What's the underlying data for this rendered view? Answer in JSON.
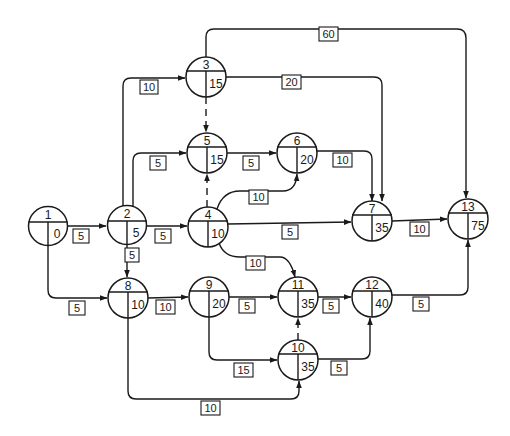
{
  "diagram": {
    "type": "activity-on-node network (earliest event times)",
    "nodes": [
      {
        "id": "1",
        "value": "0",
        "x": 48,
        "y": 226
      },
      {
        "id": "2",
        "value": "5",
        "x": 127,
        "y": 225
      },
      {
        "id": "3",
        "value": "15",
        "x": 206,
        "y": 77
      },
      {
        "id": "4",
        "value": "10",
        "x": 208,
        "y": 227
      },
      {
        "id": "5",
        "value": "15",
        "x": 207,
        "y": 153
      },
      {
        "id": "6",
        "value": "20",
        "x": 297,
        "y": 153
      },
      {
        "id": "7",
        "value": "35",
        "x": 372,
        "y": 221
      },
      {
        "id": "8",
        "value": "10",
        "x": 128,
        "y": 298
      },
      {
        "id": "9",
        "value": "20",
        "x": 209,
        "y": 297
      },
      {
        "id": "10",
        "value": "35",
        "x": 298,
        "y": 360
      },
      {
        "id": "11",
        "value": "35",
        "x": 298,
        "y": 297
      },
      {
        "id": "12",
        "value": "40",
        "x": 372,
        "y": 297
      },
      {
        "id": "13",
        "value": "75",
        "x": 468,
        "y": 219
      }
    ],
    "edges": [
      {
        "from": "1",
        "to": "2",
        "duration": "5",
        "dummy": false
      },
      {
        "from": "1",
        "to": "8",
        "duration": "5",
        "dummy": false
      },
      {
        "from": "2",
        "to": "3",
        "duration": "10",
        "dummy": false
      },
      {
        "from": "2",
        "to": "5",
        "duration": "5",
        "dummy": false
      },
      {
        "from": "2",
        "to": "4",
        "duration": "5",
        "dummy": false
      },
      {
        "from": "2",
        "to": "8",
        "duration": "5",
        "dummy": false
      },
      {
        "from": "3",
        "to": "13",
        "duration": "60",
        "dummy": false
      },
      {
        "from": "3",
        "to": "7",
        "duration": "20",
        "dummy": false
      },
      {
        "from": "3",
        "to": "5",
        "duration": "",
        "dummy": true
      },
      {
        "from": "4",
        "to": "5",
        "duration": "",
        "dummy": true
      },
      {
        "from": "5",
        "to": "6",
        "duration": "5",
        "dummy": false
      },
      {
        "from": "4",
        "to": "6",
        "duration": "10",
        "dummy": false
      },
      {
        "from": "6",
        "to": "7",
        "duration": "10",
        "dummy": false
      },
      {
        "from": "4",
        "to": "7",
        "duration": "5",
        "dummy": false
      },
      {
        "from": "4",
        "to": "11",
        "duration": "10",
        "dummy": false
      },
      {
        "from": "7",
        "to": "13",
        "duration": "10",
        "dummy": false
      },
      {
        "from": "8",
        "to": "9",
        "duration": "10",
        "dummy": false
      },
      {
        "from": "8",
        "to": "10",
        "duration": "10",
        "dummy": false
      },
      {
        "from": "9",
        "to": "11",
        "duration": "5",
        "dummy": false
      },
      {
        "from": "9",
        "to": "10",
        "duration": "15",
        "dummy": false
      },
      {
        "from": "10",
        "to": "11",
        "duration": "",
        "dummy": true
      },
      {
        "from": "11",
        "to": "12",
        "duration": "5",
        "dummy": false
      },
      {
        "from": "10",
        "to": "12",
        "duration": "5",
        "dummy": false
      },
      {
        "from": "12",
        "to": "13",
        "duration": "5",
        "dummy": false
      }
    ]
  },
  "labels": {
    "e_1_2": "5",
    "e_1_8": "5",
    "e_2_3": "10",
    "e_2_5": "5",
    "e_2_4": "5",
    "e_2_8": "5",
    "e_3_13": "60",
    "e_3_7": "20",
    "e_5_6": "5",
    "e_4_6": "10",
    "e_6_7": "10",
    "e_4_7": "5",
    "e_4_11": "10",
    "e_7_13": "10",
    "e_8_9": "10",
    "e_8_10": "10",
    "e_9_11": "5",
    "e_9_10": "15",
    "e_11_12": "5",
    "e_10_12": "5",
    "e_12_13": "5"
  },
  "nodes": {
    "n1": {
      "id": "1",
      "value": "0"
    },
    "n2": {
      "id": "2",
      "value": "5"
    },
    "n3": {
      "id": "3",
      "value": "15"
    },
    "n4": {
      "id": "4",
      "value": "10"
    },
    "n5": {
      "id": "5",
      "value": "15"
    },
    "n6": {
      "id": "6",
      "value": "20"
    },
    "n7": {
      "id": "7",
      "value": "35"
    },
    "n8": {
      "id": "8",
      "value": "10"
    },
    "n9": {
      "id": "9",
      "value": "20"
    },
    "n10": {
      "id": "10",
      "value": "35"
    },
    "n11": {
      "id": "11",
      "value": "35"
    },
    "n12": {
      "id": "12",
      "value": "40"
    },
    "n13": {
      "id": "13",
      "value": "75"
    }
  }
}
